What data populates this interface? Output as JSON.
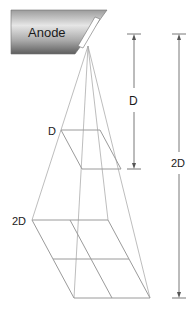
{
  "diagram": {
    "anode_label": "Anode",
    "near_plane_label": "D",
    "far_plane_label": "2D",
    "distance_near_label": "D",
    "distance_far_label": "2D",
    "colors": {
      "line": "#9a9a9a",
      "arrow": "#555555",
      "anode_dark": "#6e6e6e",
      "anode_light": "#d8d8d8",
      "text": "#1a1a1a"
    }
  }
}
